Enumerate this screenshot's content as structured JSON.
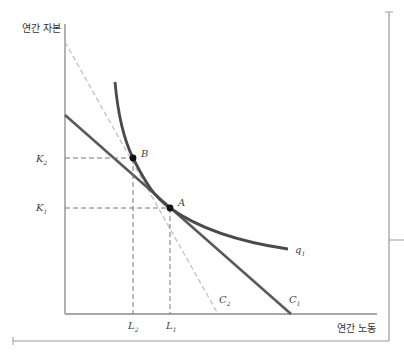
{
  "diagram": {
    "y_axis_title": "연간 자본",
    "x_axis_title": "연간 노동",
    "isoquant": {
      "name": "q",
      "sub": "1"
    },
    "cost_lines": [
      {
        "name": "C",
        "sub": "1",
        "style": "solid"
      },
      {
        "name": "C",
        "sub": "2",
        "style": "dashed"
      }
    ],
    "points": [
      {
        "name": "A"
      },
      {
        "name": "B"
      }
    ],
    "y_ticks": [
      {
        "name": "K",
        "sub": "2"
      },
      {
        "name": "K",
        "sub": "1"
      }
    ],
    "x_ticks": [
      {
        "name": "L",
        "sub": "2"
      },
      {
        "name": "L",
        "sub": "1"
      }
    ],
    "colors": {
      "axis": "#8a8a8a",
      "curve": "#4a4a4a",
      "cost_line_1": "#5a5a5a",
      "cost_line_2": "#bdbdbd",
      "guides": "#777777",
      "frame": "#9a9a9a"
    }
  }
}
